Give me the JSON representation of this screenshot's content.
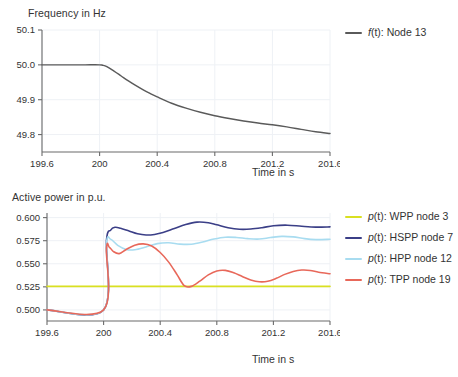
{
  "charts": [
    {
      "id": "frequency",
      "title": "Frequency in Hz",
      "xlabel": "Time in s",
      "legend_pos": "right",
      "chart_data": {
        "type": "line",
        "title": "Frequency in Hz",
        "xlabel": "Time in s",
        "ylabel": "Frequency in Hz",
        "xlim": [
          199.6,
          201.6
        ],
        "ylim": [
          49.75,
          50.1
        ],
        "xticks": [
          "199.6",
          "200",
          "200.4",
          "200.8",
          "201.2",
          "201.6"
        ],
        "xtick_values": [
          199.6,
          200,
          200.4,
          200.8,
          201.2,
          201.6
        ],
        "yticks": [
          "50.1",
          "50.0",
          "49.9",
          "49.8"
        ],
        "ytick_values": [
          50.1,
          50.0,
          49.9,
          49.8
        ],
        "grid": true,
        "series": [
          {
            "name": "f(t): Node 13",
            "name_italic": "f",
            "name_rest": "(t): Node 13",
            "color": "#5a5a5a",
            "x": [
              199.6,
              199.7,
              199.8,
              199.9,
              200.0,
              200.02,
              200.05,
              200.1,
              200.15,
              200.2,
              200.25,
              200.3,
              200.35,
              200.4,
              200.5,
              200.6,
              200.7,
              200.8,
              200.9,
              201.0,
              201.1,
              201.2,
              201.3,
              201.4,
              201.5,
              201.6
            ],
            "y": [
              50.0,
              50.0,
              50.0,
              50.0,
              50.0,
              49.999,
              49.995,
              49.982,
              49.968,
              49.954,
              49.941,
              49.929,
              49.918,
              49.908,
              49.89,
              49.876,
              49.864,
              49.854,
              49.846,
              49.839,
              49.833,
              49.828,
              49.822,
              49.815,
              49.808,
              49.803
            ]
          }
        ]
      }
    },
    {
      "id": "active-power",
      "title": "Active power in p.u.",
      "xlabel": "Time in s",
      "legend_pos": "right",
      "chart_data": {
        "type": "line",
        "title": "Active power in p.u.",
        "xlabel": "Time in s",
        "ylabel": "Active power in p.u.",
        "xlim": [
          199.6,
          201.6
        ],
        "ylim": [
          0.488,
          0.605
        ],
        "xticks": [
          "199.6",
          "200",
          "200.4",
          "200.8",
          "201.2",
          "201.6"
        ],
        "xtick_values": [
          199.6,
          200,
          200.4,
          200.8,
          201.2,
          201.6
        ],
        "yticks": [
          "0.600",
          "0.575",
          "0.550",
          "0.525",
          "0.500"
        ],
        "ytick_values": [
          0.6,
          0.575,
          0.55,
          0.525,
          0.5
        ],
        "grid": true,
        "series": [
          {
            "name": "p(t): WPP node 3",
            "name_italic": "p",
            "name_rest": "(t): WPP node 3",
            "color": "#d9e021",
            "x": [
              199.6,
              201.6
            ],
            "y": [
              0.5255,
              0.5255
            ]
          },
          {
            "name": "p(t): HSPP node 7",
            "name_italic": "p",
            "name_rest": "(t): HSPP node 7",
            "color": "#3b3f87",
            "x": [
              199.6,
              200.0,
              200.02,
              200.05,
              200.08,
              200.12,
              200.18,
              200.24,
              200.3,
              200.36,
              200.42,
              200.5,
              200.58,
              200.66,
              200.74,
              200.8,
              200.88,
              200.96,
              201.04,
              201.12,
              201.2,
              201.3,
              201.4,
              201.5,
              201.6
            ],
            "y": [
              0.5,
              0.5,
              0.575,
              0.5865,
              0.5895,
              0.5885,
              0.5855,
              0.5825,
              0.5812,
              0.5818,
              0.5838,
              0.5882,
              0.5925,
              0.5951,
              0.5945,
              0.5922,
              0.5891,
              0.5874,
              0.5876,
              0.5891,
              0.5912,
              0.5918,
              0.5906,
              0.5897,
              0.59
            ]
          },
          {
            "name": "p(t): HPP node 12",
            "name_italic": "p",
            "name_rest": "(t): HPP node 12",
            "color": "#a8dcf0",
            "x": [
              199.6,
              200.0,
              200.02,
              200.05,
              200.1,
              200.16,
              200.22,
              200.3,
              200.38,
              200.46,
              200.54,
              200.62,
              200.7,
              200.78,
              200.86,
              200.94,
              201.02,
              201.1,
              201.18,
              201.26,
              201.34,
              201.42,
              201.5,
              201.6
            ],
            "y": [
              0.5,
              0.5,
              0.572,
              0.5765,
              0.57,
              0.5655,
              0.5652,
              0.5682,
              0.5718,
              0.5727,
              0.5713,
              0.5712,
              0.5735,
              0.5768,
              0.5788,
              0.5785,
              0.5772,
              0.5768,
              0.5784,
              0.5797,
              0.5791,
              0.5772,
              0.5762,
              0.5765
            ]
          },
          {
            "name": "p(t): TPP node 19",
            "name_italic": "p",
            "name_rest": "(t): TPP node 19",
            "color": "#e8685a",
            "x": [
              199.6,
              200.0,
              200.02,
              200.04,
              200.07,
              200.11,
              200.16,
              200.22,
              200.28,
              200.34,
              200.4,
              200.46,
              200.52,
              200.57,
              200.62,
              200.68,
              200.74,
              200.8,
              200.86,
              200.92,
              200.98,
              201.04,
              201.1,
              201.16,
              201.22,
              201.28,
              201.34,
              201.4,
              201.46,
              201.52,
              201.6
            ],
            "y": [
              0.5,
              0.5,
              0.5665,
              0.568,
              0.5632,
              0.561,
              0.5655,
              0.57,
              0.5715,
              0.5692,
              0.5622,
              0.5518,
              0.538,
              0.5262,
              0.5255,
              0.5312,
              0.538,
              0.5422,
              0.5428,
              0.5402,
              0.5362,
              0.5325,
              0.5305,
              0.531,
              0.5342,
              0.5385,
              0.5417,
              0.5432,
              0.5428,
              0.5408,
              0.5392
            ]
          }
        ]
      }
    }
  ]
}
